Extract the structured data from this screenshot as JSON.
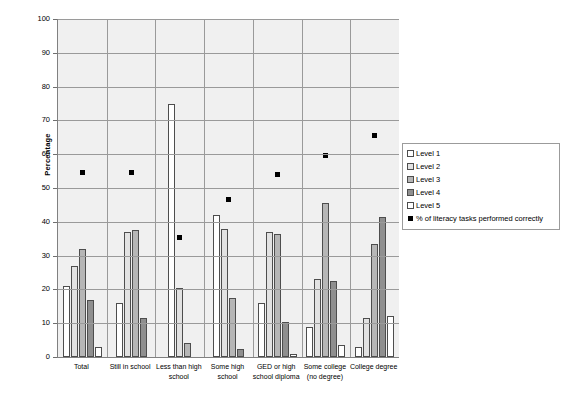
{
  "chart_data": {
    "type": "bar",
    "title": "",
    "xlabel": "",
    "ylabel": "Percentage",
    "ylim": [
      0,
      100
    ],
    "ytick_step": 10,
    "yticks": [
      0,
      10,
      20,
      30,
      40,
      50,
      60,
      70,
      80,
      90,
      100
    ],
    "grid": true,
    "legend_position": "right",
    "categories": [
      "Total",
      "Still in school",
      "Less than high school",
      "Some high school",
      "GED or high school diploma",
      "Some college (no degree)",
      "College degree"
    ],
    "series": [
      {
        "name": "Level 1",
        "type": "bar",
        "color": "#ffffff",
        "values": [
          21,
          16,
          75,
          42,
          16,
          9,
          3
        ]
      },
      {
        "name": "Level 2",
        "type": "bar",
        "color": "#e2e2e2",
        "values": [
          27,
          37,
          20.5,
          38,
          37,
          23,
          11.5
        ]
      },
      {
        "name": "Level 3",
        "type": "bar",
        "color": "#b6b6b6",
        "values": [
          32,
          37.5,
          4,
          17.5,
          36.5,
          45.5,
          33.5
        ]
      },
      {
        "name": "Level 4",
        "type": "bar",
        "color": "#8f8f8f",
        "values": [
          17,
          11.5,
          0,
          2.5,
          10.5,
          22.5,
          41.5
        ]
      },
      {
        "name": "Level 5",
        "type": "bar",
        "color": "#ffffff",
        "values": [
          3,
          0,
          0,
          0,
          1,
          3.5,
          12
        ]
      },
      {
        "name": "% of literacy tasks performed correctly",
        "type": "scatter",
        "color": "#000000",
        "values": [
          54.5,
          54.5,
          35.5,
          46.5,
          54,
          59.5,
          65.5
        ]
      }
    ]
  },
  "legend": {
    "items": [
      {
        "label": "Level 1",
        "swatch": "lv1"
      },
      {
        "label": "Level 2",
        "swatch": "lv2"
      },
      {
        "label": "Level 3",
        "swatch": "lv3"
      },
      {
        "label": "Level 4",
        "swatch": "lv4"
      },
      {
        "label": "Level 5",
        "swatch": "lv5"
      },
      {
        "label": "% of literacy tasks performed correctly",
        "swatch": "sq"
      }
    ]
  }
}
